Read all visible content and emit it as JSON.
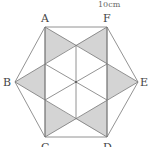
{
  "figure": {
    "caption_top": "10cm",
    "labels": {
      "A": "A",
      "F": "F",
      "B": "B",
      "E": "E",
      "C": "C",
      "D": "D"
    },
    "shade_color": "#d4d4d4",
    "line_color": "#777777"
  }
}
